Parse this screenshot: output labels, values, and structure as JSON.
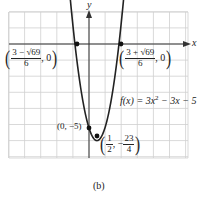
{
  "chart_data": {
    "type": "line",
    "title": "",
    "function": "f(x) = 3x^2 - 3x - 5",
    "xlabel": "x",
    "ylabel": "y",
    "xlim": [
      -5,
      6
    ],
    "ylim": [
      -7,
      2
    ],
    "grid": true,
    "points": [
      {
        "label": "x-intercept left",
        "x": -0.884,
        "y": 0,
        "text": "((3 - √69)/6, 0)"
      },
      {
        "label": "x-intercept right",
        "x": 1.884,
        "y": 0,
        "text": "((3 + √69)/6, 0)"
      },
      {
        "label": "y-intercept",
        "x": 0,
        "y": -5,
        "text": "(0, −5)"
      },
      {
        "label": "vertex",
        "x": 0.5,
        "y": -5.75,
        "text": "(1/2, −23/4)"
      }
    ],
    "caption": "(b)"
  },
  "labels": {
    "x_axis": "x",
    "y_axis": "y",
    "left_intercept": {
      "num": "3 − √69",
      "den": "6",
      "tail": ", 0"
    },
    "right_intercept": {
      "num": "3 + √69",
      "den": "6",
      "tail": ", 0"
    },
    "y_intercept": "(0, −5)",
    "vertex": {
      "num1": "1",
      "den1": "2",
      "sep": ", −",
      "num2": "23",
      "den2": "4"
    },
    "equation": {
      "lhs": "f(x) = 3x",
      "exp": "2",
      "rhs": " − 3x − 5"
    },
    "caption": "(b)"
  },
  "colors": {
    "grid": "#c8c8c8",
    "axis": "#333333",
    "curve": "#222222",
    "point": "#111111"
  }
}
